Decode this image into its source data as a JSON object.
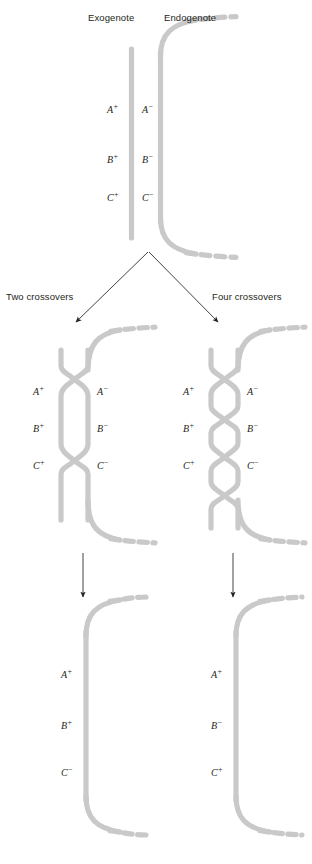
{
  "figure": {
    "strand_color": "#c9c9c9",
    "line_color": "#231f20",
    "text_color": "#231f20"
  },
  "header": {
    "exogenote_label": "Exogenote",
    "endogenote_label": "Endogenote"
  },
  "top_panel": {
    "exogenote_alleles": [
      {
        "gene": "A",
        "sign": "+"
      },
      {
        "gene": "B",
        "sign": "+"
      },
      {
        "gene": "C",
        "sign": "+"
      }
    ],
    "endogenote_alleles": [
      {
        "gene": "A",
        "sign": "−"
      },
      {
        "gene": "B",
        "sign": "−"
      },
      {
        "gene": "C",
        "sign": "−"
      }
    ]
  },
  "branches": {
    "left_label": "Two crossovers",
    "right_label": "Four crossovers"
  },
  "left_panel": {
    "crossover_count": 2,
    "exogenote_alleles": [
      {
        "gene": "A",
        "sign": "+"
      },
      {
        "gene": "B",
        "sign": "+"
      },
      {
        "gene": "C",
        "sign": "+"
      }
    ],
    "endogenote_alleles": [
      {
        "gene": "A",
        "sign": "−"
      },
      {
        "gene": "B",
        "sign": "−"
      },
      {
        "gene": "C",
        "sign": "−"
      }
    ]
  },
  "right_panel": {
    "crossover_count": 4,
    "exogenote_alleles": [
      {
        "gene": "A",
        "sign": "+"
      },
      {
        "gene": "B",
        "sign": "+"
      },
      {
        "gene": "C",
        "sign": "+"
      }
    ],
    "endogenote_alleles": [
      {
        "gene": "A",
        "sign": "−"
      },
      {
        "gene": "B",
        "sign": "−"
      },
      {
        "gene": "C",
        "sign": "−"
      }
    ]
  },
  "left_result": {
    "alleles": [
      {
        "gene": "A",
        "sign": "+"
      },
      {
        "gene": "B",
        "sign": "+"
      },
      {
        "gene": "C",
        "sign": "−"
      }
    ]
  },
  "right_result": {
    "alleles": [
      {
        "gene": "A",
        "sign": "+"
      },
      {
        "gene": "B",
        "sign": "−"
      },
      {
        "gene": "C",
        "sign": "+"
      }
    ]
  },
  "caption": {
    "text": ""
  }
}
